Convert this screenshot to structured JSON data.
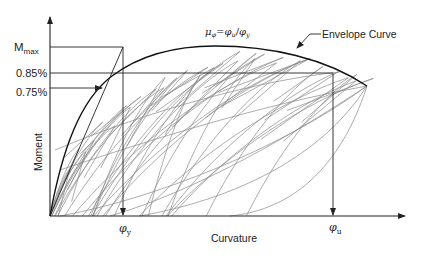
{
  "figure": {
    "y_axis_label": "Moment",
    "x_axis_label": "Curvature",
    "y_ticks": {
      "m_max": {
        "base": "M",
        "sub": "max"
      },
      "p085": "0.85%",
      "p075": "0.75%"
    },
    "x_ticks": {
      "phi_y": {
        "base": "φ",
        "sub": "y"
      },
      "phi_u": {
        "base": "φ",
        "sub": "u"
      }
    },
    "ductility_equation": {
      "mu": "μ",
      "mu_sub": "φ",
      "eq": "=",
      "num": "φ",
      "num_sub": "u",
      "slash": "/",
      "den": "φ",
      "den_sub": "y"
    },
    "annotation": "Envelope Curve",
    "colors": {
      "axes": "#222222",
      "envelope": "#111111",
      "loops": "#8a8a8a"
    }
  }
}
